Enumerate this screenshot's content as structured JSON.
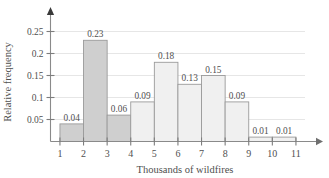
{
  "chart_data": {
    "type": "bar",
    "title": "",
    "xlabel": "Thousands of wildfires",
    "ylabel": "Relative frequency",
    "categories": [
      "1-2",
      "2-3",
      "3-4",
      "4-5",
      "5-6",
      "6-7",
      "7-8",
      "8-9",
      "9-10",
      "10-11"
    ],
    "bin_edges": [
      1,
      2,
      3,
      4,
      5,
      6,
      7,
      8,
      9,
      10,
      11
    ],
    "values": [
      0.04,
      0.23,
      0.06,
      0.09,
      0.18,
      0.13,
      0.15,
      0.09,
      0.01,
      0.01
    ],
    "bar_labels": [
      "0.04",
      "0.23",
      "0.06",
      "0.09",
      "0.18",
      "0.13",
      "0.15",
      "0.09",
      "0.01",
      "0.01"
    ],
    "bar_shades": [
      "dark",
      "dark",
      "dark",
      "light",
      "light",
      "light",
      "light",
      "light",
      "light",
      "light"
    ],
    "xlim": [
      0.6,
      11.6
    ],
    "ylim": [
      0,
      0.27
    ],
    "xticks": [
      1,
      2,
      3,
      4,
      5,
      6,
      7,
      8,
      9,
      10,
      11
    ],
    "xtick_labels": [
      "1",
      "2",
      "3",
      "4",
      "5",
      "6",
      "7",
      "8",
      "9",
      "10",
      "11"
    ],
    "yticks": [
      0.05,
      0.1,
      0.15,
      0.2,
      0.25
    ],
    "ytick_labels": [
      "0.05",
      "0.1",
      "0.15",
      "0.2",
      "0.25"
    ],
    "grid": true,
    "grid_axis": "y",
    "legend": "none",
    "axis_arrows": [
      "x-right",
      "y-up"
    ],
    "colors": {
      "bar_dark": "#cfcfcf",
      "bar_light": "#f0f0f0",
      "bar_edge": "#9a9a9a",
      "axis": "#8a8a8a",
      "grid": "#e3e3e3",
      "text": "#4f4f4f",
      "background": "#ffffff"
    }
  }
}
